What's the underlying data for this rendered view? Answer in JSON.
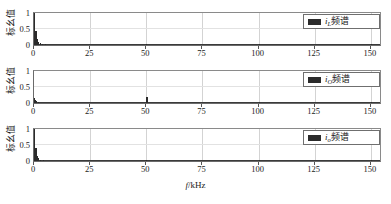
{
  "figure": {
    "xlabel_italic": "f",
    "xlabel_rest": "/kHz",
    "ylabel": "标幺值",
    "spectrum_word": "频谱"
  },
  "chart_data": {
    "type": "line",
    "title": "",
    "xlabel": "f/kHz",
    "ylabel": "标幺值",
    "xlim": [
      0,
      155
    ],
    "ylim": [
      0,
      1.05
    ],
    "xticks": [
      0,
      25,
      50,
      75,
      100,
      125,
      150
    ],
    "yticks": [
      0,
      0.5,
      1
    ],
    "grid": true,
    "legend_position": "upper right",
    "subplots": [
      {
        "index": 0,
        "legend": "iL频谱",
        "legend_symbol": "i",
        "legend_sub": "L",
        "legend_suffix": "频谱",
        "series_name": "iL spectrum",
        "peaks": [
          {
            "f": 0.0,
            "value": 1.0
          },
          {
            "f": 0.6,
            "value": 0.42
          },
          {
            "f": 1.2,
            "value": 0.18
          },
          {
            "f": 1.8,
            "value": 0.09
          },
          {
            "f": 2.6,
            "value": 0.05
          },
          {
            "f": 3.5,
            "value": 0.03
          },
          {
            "f": 5.0,
            "value": 0.02
          },
          {
            "f": 50.0,
            "value": 0.012
          },
          {
            "f": 100.0,
            "value": 0.008
          },
          {
            "f": 150.0,
            "value": 0.008
          }
        ],
        "noise_floor": 0.004
      },
      {
        "index": 1,
        "legend": "iO频谱",
        "legend_symbol": "i",
        "legend_sub": "O",
        "legend_suffix": "频谱",
        "series_name": "iO spectrum",
        "peaks": [
          {
            "f": 0.0,
            "value": 0.16
          },
          {
            "f": 0.5,
            "value": 0.1
          },
          {
            "f": 1.0,
            "value": 0.05
          },
          {
            "f": 1.6,
            "value": 0.03
          },
          {
            "f": 50.0,
            "value": 0.2
          },
          {
            "f": 100.0,
            "value": 0.035
          },
          {
            "f": 150.0,
            "value": 0.035
          }
        ],
        "noise_floor": 0.006
      },
      {
        "index": 2,
        "legend": "io频谱",
        "legend_symbol": "i",
        "legend_sub": "o",
        "legend_suffix": "频谱",
        "series_name": "io spectrum",
        "peaks": [
          {
            "f": 0.0,
            "value": 1.0
          },
          {
            "f": 0.6,
            "value": 0.4
          },
          {
            "f": 1.2,
            "value": 0.16
          },
          {
            "f": 1.9,
            "value": 0.08
          },
          {
            "f": 2.8,
            "value": 0.04
          },
          {
            "f": 4.0,
            "value": 0.025
          },
          {
            "f": 50.0,
            "value": 0.01
          },
          {
            "f": 100.0,
            "value": 0.006
          },
          {
            "f": 150.0,
            "value": 0.006
          }
        ],
        "noise_floor": 0.004
      }
    ],
    "colors": {
      "trace": "#2b2b2b",
      "axis": "#6b6b6b",
      "grid": "#d3d3d3",
      "background": "#ffffff"
    }
  }
}
